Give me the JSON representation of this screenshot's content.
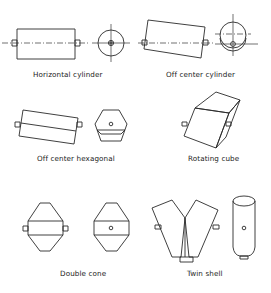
{
  "figure": {
    "mixers": [
      {
        "id": "horizontal-cylinder",
        "label": "Horizontal cylinder"
      },
      {
        "id": "off-center-cylinder",
        "label": "Off center cylinder"
      },
      {
        "id": "off-center-hexagonal",
        "label": "Off center hexagonal"
      },
      {
        "id": "rotating-cube",
        "label": "Rotating cube"
      },
      {
        "id": "double-cone",
        "label": "Double cone"
      },
      {
        "id": "twin-shell",
        "label": "Twin shell"
      }
    ],
    "line_color": "#2a2a2a",
    "background": "#ffffff"
  }
}
